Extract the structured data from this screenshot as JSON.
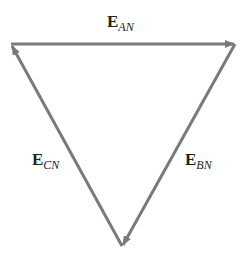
{
  "diagram": {
    "type": "phasor-triangle",
    "line_color": "#7a7a7a",
    "vertices": {
      "top_left": [
        11,
        44
      ],
      "top_right": [
        235,
        44
      ],
      "bottom": [
        122,
        246
      ]
    },
    "vectors": [
      {
        "id": "EAN",
        "main": "E",
        "sub": "AN",
        "from": "top_left",
        "to": "top_right"
      },
      {
        "id": "EBN",
        "main": "E",
        "sub": "BN",
        "from": "top_right",
        "to": "bottom"
      },
      {
        "id": "ECN",
        "main": "E",
        "sub": "CN",
        "from": "bottom",
        "to": "top_left"
      }
    ]
  },
  "labels": {
    "ean": {
      "main": "E",
      "sub": "AN"
    },
    "ebn": {
      "main": "E",
      "sub": "BN"
    },
    "ecn": {
      "main": "E",
      "sub": "CN"
    }
  }
}
